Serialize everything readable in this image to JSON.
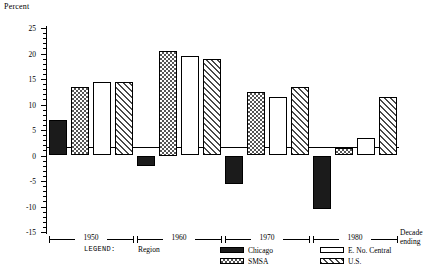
{
  "chart_data": {
    "type": "bar",
    "title": "",
    "ylabel": "Percent",
    "xlabel": "Decade ending",
    "ylim": [
      -15,
      25
    ],
    "ytick_step": 5,
    "yticks": [
      25,
      20,
      15,
      10,
      5,
      0,
      -5,
      -10,
      -15
    ],
    "ytick_labels": [
      "25",
      "20",
      "15",
      "10",
      "5",
      "0",
      "-5",
      "-10",
      "-15"
    ],
    "grid": false,
    "legend_position": "below-axis",
    "legend_title": "LEGEND:",
    "legend_group_label": "Region",
    "categories": [
      "1950",
      "1960",
      "1970",
      "1980"
    ],
    "series": [
      {
        "name": "Chicago",
        "pattern": "solid",
        "values": [
          7.0,
          -2.0,
          -5.5,
          -10.5
        ]
      },
      {
        "name": "SMSA",
        "pattern": "checker",
        "values": [
          13.5,
          20.5,
          12.5,
          1.5
        ]
      },
      {
        "name": "E. No. Central",
        "pattern": "open",
        "values": [
          14.5,
          19.5,
          11.5,
          3.5
        ]
      },
      {
        "name": "U.S.",
        "pattern": "diagonal",
        "values": [
          14.5,
          19.0,
          13.5,
          11.5
        ]
      }
    ]
  },
  "axis": {
    "y_title": "Percent",
    "x_title_line1": "Decade",
    "x_title_line2": "ending"
  },
  "legend": {
    "label": "LEGEND:",
    "region": "Region",
    "items": [
      {
        "name": "Chicago"
      },
      {
        "name": "SMSA"
      },
      {
        "name": "E. No. Central"
      },
      {
        "name": "U.S."
      }
    ]
  },
  "colors": {
    "axis": "#000000",
    "chicago": "#1b1b1b",
    "smsa": "#555555",
    "enc": "#ffffff",
    "us": "#4a4a4a"
  }
}
